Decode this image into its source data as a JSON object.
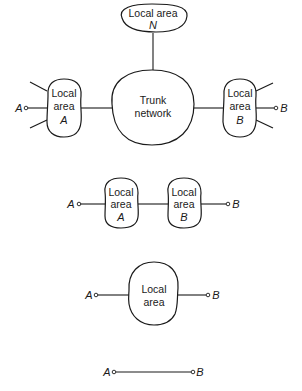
{
  "diagram": {
    "panels": [
      {
        "id": "panel-1",
        "description": "Trunk network connecting local areas",
        "nodes": {
          "local_area_n": {
            "line1": "Local area",
            "line2": "N"
          },
          "trunk": {
            "line1": "Trunk",
            "line2": "network"
          },
          "local_area_a": {
            "line1": "Local",
            "line2": "area",
            "line3": "A"
          },
          "local_area_b": {
            "line1": "Local",
            "line2": "area",
            "line3": "B"
          }
        },
        "terminals": {
          "a": "A",
          "b": "B"
        }
      },
      {
        "id": "panel-2",
        "description": "Two adjacent local areas",
        "nodes": {
          "local_area_a": {
            "line1": "Local",
            "line2": "area",
            "line3": "A"
          },
          "local_area_b": {
            "line1": "Local",
            "line2": "area",
            "line3": "B"
          }
        },
        "terminals": {
          "a": "A",
          "b": "B"
        }
      },
      {
        "id": "panel-3",
        "description": "Single local area",
        "nodes": {
          "local_area": {
            "line1": "Local",
            "line2": "area"
          }
        },
        "terminals": {
          "a": "A",
          "b": "B"
        }
      },
      {
        "id": "panel-4",
        "description": "Direct connection",
        "terminals": {
          "a": "A",
          "b": "B"
        }
      }
    ],
    "colors": {
      "ink": "#1a1a1a",
      "background": "#ffffff"
    }
  }
}
